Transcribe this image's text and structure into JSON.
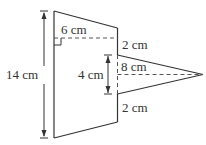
{
  "diagram": {
    "type": "composite-figure",
    "colors": {
      "stroke": "#333333",
      "background": "#ffffff"
    },
    "labels": {
      "height_total": "14 cm",
      "trapezoid_width": "6 cm",
      "top_gap": "2 cm",
      "triangle_base": "4 cm",
      "triangle_height": "8 cm",
      "bottom_gap": "2 cm"
    }
  }
}
